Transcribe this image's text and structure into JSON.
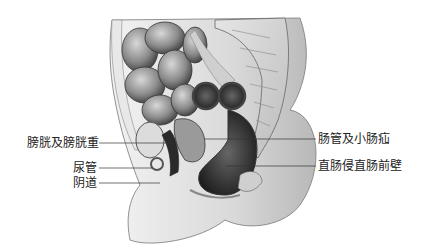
{
  "figure": {
    "type": "anatomical-illustration",
    "labels_left": [
      {
        "id": "bladder",
        "text": "膀胱及膀胱重"
      },
      {
        "id": "urethra",
        "text": "尿管"
      },
      {
        "id": "vagina",
        "text": "阴道"
      }
    ],
    "labels_right": [
      {
        "id": "bowel",
        "text": "肠管及小肠疝"
      },
      {
        "id": "rectum",
        "text": "直肠侵直肠前壁"
      }
    ]
  }
}
